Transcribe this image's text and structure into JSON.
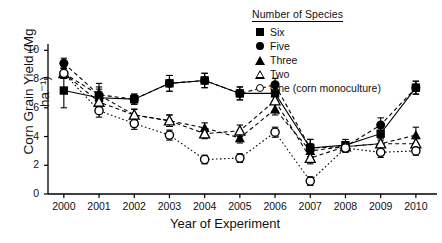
{
  "chart_data": {
    "type": "scatter",
    "title": "",
    "xlabel": "Year of Experiment",
    "ylabel": "Corn Grain Yield (Mg ha⁻¹)",
    "x": [
      2000,
      2001,
      2002,
      2003,
      2004,
      2005,
      2006,
      2007,
      2008,
      2009,
      2010
    ],
    "xlim": [
      1999.55,
      2010.6
    ],
    "ylim": [
      0,
      10.3
    ],
    "yticks": [
      0,
      2,
      4,
      6,
      8,
      10
    ],
    "xticks": [
      "2000",
      "2001",
      "2002",
      "2003",
      "2004",
      "2005",
      "2006",
      "2007",
      "2008",
      "2009",
      "2010"
    ],
    "grid": false,
    "legend_position": "top-right",
    "legend_title": "Number of Species",
    "series": [
      {
        "name": "Six",
        "marker": "filled-square",
        "linestyle": "solid",
        "values": [
          7.2,
          6.7,
          6.6,
          7.7,
          7.9,
          7.0,
          7.0,
          3.2,
          3.4,
          4.2,
          7.4
        ],
        "err": [
          1.2,
          0.75,
          0.35,
          0.55,
          0.5,
          0.45,
          0.5,
          0.6,
          0.4,
          0.45,
          0.45
        ]
      },
      {
        "name": "Five",
        "marker": "filled-circle",
        "linestyle": "dashed",
        "values": [
          9.1,
          6.9,
          6.6,
          7.7,
          7.9,
          7.0,
          7.6,
          3.2,
          3.3,
          4.8,
          7.4
        ],
        "err": [
          0.35,
          0.4,
          0.35,
          0.55,
          0.5,
          0.45,
          0.45,
          0.6,
          0.35,
          0.5,
          0.45
        ]
      },
      {
        "name": "Three",
        "marker": "filled-triangle",
        "linestyle": "dashed",
        "values": [
          8.4,
          6.9,
          5.5,
          5.1,
          4.6,
          3.9,
          5.9,
          3.0,
          3.3,
          3.5,
          4.1
        ],
        "err": [
          0.35,
          0.8,
          0.4,
          0.4,
          0.35,
          0.35,
          0.4,
          0.5,
          0.3,
          0.4,
          0.55
        ]
      },
      {
        "name": "Two",
        "marker": "open-triangle",
        "linestyle": "dashed",
        "values": [
          8.4,
          6.4,
          5.5,
          5.1,
          4.2,
          4.4,
          6.5,
          2.5,
          3.3,
          3.5,
          3.5
        ],
        "err": [
          0.35,
          0.45,
          0.4,
          0.4,
          0.35,
          0.4,
          0.7,
          0.4,
          0.3,
          0.4,
          0.35
        ]
      },
      {
        "name": "One (corn monoculture)",
        "marker": "open-circle",
        "linestyle": "dotted",
        "values": [
          8.4,
          5.8,
          4.9,
          4.1,
          2.4,
          2.5,
          4.3,
          0.9,
          3.2,
          2.9,
          3.0
        ],
        "err": [
          0.35,
          0.45,
          0.4,
          0.35,
          0.3,
          0.3,
          0.35,
          0.3,
          0.3,
          0.35,
          0.3
        ]
      }
    ]
  },
  "legend": {
    "title": "Number of Species",
    "items": [
      {
        "label": "Six",
        "marker": "filled-square"
      },
      {
        "label": "Five",
        "marker": "filled-circle"
      },
      {
        "label": "Three",
        "marker": "filled-triangle"
      },
      {
        "label": "Two",
        "marker": "open-triangle"
      },
      {
        "label": "One (corn monoculture)",
        "marker": "open-circle"
      }
    ]
  },
  "axes": {
    "y_title": "Corn Grain Yield (Mg ha⁻¹)",
    "x_title": "Year of Experiment"
  }
}
